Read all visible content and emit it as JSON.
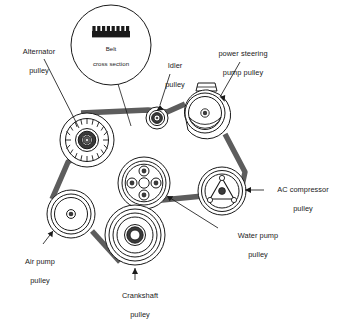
{
  "diagram": {
    "colors": {
      "belt": "#5d5d5d",
      "outline": "#1a1a1a",
      "text": "#1a1a1a",
      "background": "#ffffff",
      "hub_fill": "#3a3a3a"
    },
    "inset": {
      "label": "Belt\ncross section",
      "line1": "Belt",
      "line2": "cross section",
      "rib_count": 8,
      "shape": "ribbed-belt-profile"
    },
    "labels": [
      {
        "id": "alternator",
        "name": "Alternator pulley",
        "line1": "Alternator",
        "line2": "pulley",
        "x": 8,
        "y": 38,
        "w": 62
      },
      {
        "id": "idler",
        "name": "Idler pulley",
        "line1": "Idler",
        "line2": "pulley",
        "x": 153,
        "y": 52,
        "w": 44
      },
      {
        "id": "power-steering",
        "name": "power steering pump pulley",
        "line1": "power steering",
        "line2": "pump pulley",
        "x": 201,
        "y": 40,
        "w": 84
      },
      {
        "id": "ac-compressor",
        "name": "AC compressor pulley",
        "line1": "AC compressor",
        "line2": "pulley",
        "x": 266,
        "y": 176,
        "w": 74
      },
      {
        "id": "water-pump",
        "name": "Water pump pulley",
        "line1": "Water pump",
        "line2": "pulley",
        "x": 222,
        "y": 222,
        "w": 72
      },
      {
        "id": "air-pump",
        "name": "Air pump pulley",
        "line1": "Air pump",
        "line2": "pulley",
        "x": 11,
        "y": 248,
        "w": 58
      },
      {
        "id": "crankshaft",
        "name": "Crankshaft pulley",
        "line1": "Crankshaft",
        "line2": "pulley",
        "x": 104,
        "y": 282,
        "w": 72
      }
    ],
    "pulleys": [
      {
        "id": "alternator",
        "name": "alternator-pulley",
        "cx": 87,
        "cy": 140,
        "r": 27,
        "style": "toothed"
      },
      {
        "id": "idler",
        "name": "idler-pulley",
        "cx": 157,
        "cy": 118,
        "r": 11,
        "style": "small-double"
      },
      {
        "id": "power-steering",
        "name": "power-steering-pulley",
        "cx": 205,
        "cy": 113,
        "r": 23,
        "style": "reservoir"
      },
      {
        "id": "ac-compressor",
        "name": "ac-compressor-pulley",
        "cx": 222,
        "cy": 191,
        "r": 24,
        "style": "clutch-triangle"
      },
      {
        "id": "water-pump",
        "name": "water-pump-pulley",
        "cx": 144,
        "cy": 183,
        "r": 26,
        "style": "four-bolt"
      },
      {
        "id": "crankshaft",
        "name": "crankshaft-pulley",
        "cx": 135,
        "cy": 235,
        "r": 30,
        "style": "concentric-deep"
      },
      {
        "id": "air-pump",
        "name": "air-pump-pulley",
        "cx": 71,
        "cy": 214,
        "r": 24,
        "style": "concentric-triple"
      }
    ],
    "belt_path": {
      "type": "closed-loop",
      "segments": [
        "alternator-top -> idler-bottom",
        "idler-top -> power-steering-left",
        "power-steering-right -> ac-compressor-top",
        "ac-compressor-left -> water-pump-bottom",
        "water-pump-bottom -> crankshaft-top",
        "crankshaft-left -> air-pump-bottom",
        "air-pump-left -> alternator-bottom-left"
      ]
    }
  }
}
